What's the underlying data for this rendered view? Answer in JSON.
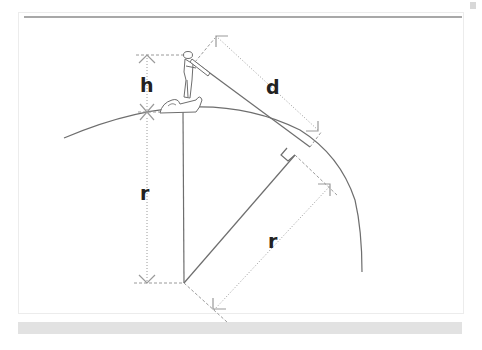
{
  "diagram": {
    "labels": {
      "height": "h",
      "distance": "d",
      "radius_vertical": "r",
      "radius_diagonal": "r"
    },
    "elements": [
      "observer-figure-on-rock",
      "earth-surface-arc",
      "line-of-sight-tangent",
      "right-angle-marker",
      "center-point"
    ],
    "colors": {
      "line": "#6e6e6e",
      "dimension": "#9a9a9a",
      "text": "#222222",
      "frame_rule": "#a8a8a8",
      "bottom_band": "#e2e2e2"
    }
  }
}
